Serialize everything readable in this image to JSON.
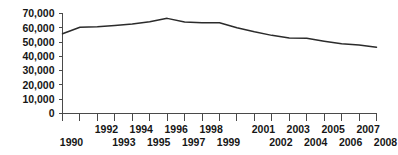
{
  "chart_data": {
    "type": "line",
    "title": "",
    "subtitle": "",
    "xlabel": "",
    "ylabel": "",
    "grid": false,
    "legend": false,
    "legend_position": "none",
    "x": [
      1990,
      1991,
      1992,
      1993,
      1994,
      1995,
      1996,
      1997,
      1998,
      1999,
      2000,
      2001,
      2002,
      2003,
      2004,
      2005,
      2006,
      2007,
      2008
    ],
    "categories": [
      "1990",
      "1991",
      "1992",
      "1993",
      "1994",
      "1995",
      "1996",
      "1997",
      "1998",
      "1999",
      "2000",
      "2001",
      "2002",
      "2003",
      "2004",
      "2005",
      "2006",
      "2007",
      "2008"
    ],
    "values": [
      55800,
      60400,
      60800,
      61600,
      62600,
      64200,
      66600,
      64100,
      63600,
      63500,
      60000,
      57200,
      54700,
      52800,
      52600,
      50600,
      48800,
      48000,
      46400
    ],
    "series": [
      {
        "name": "",
        "color": "#2b2b2b",
        "values": [
          55800,
          60400,
          60800,
          61600,
          62600,
          64200,
          66600,
          64100,
          63600,
          63500,
          60000,
          57200,
          54700,
          52800,
          52600,
          50600,
          48800,
          48000,
          46400
        ]
      }
    ],
    "xlim": [
      1990,
      2008
    ],
    "ylim": [
      0,
      70000
    ],
    "yticks": [
      0,
      10000,
      20000,
      30000,
      40000,
      50000,
      60000,
      70000
    ],
    "ytick_labels": [
      "0",
      "10,000",
      "20,000",
      "30,000",
      "40,000",
      "50,000",
      "60,000",
      "70,000"
    ],
    "xticks": [
      1990,
      1991,
      1992,
      1993,
      1994,
      1995,
      1996,
      1997,
      1998,
      1999,
      2000,
      2001,
      2002,
      2003,
      2004,
      2005,
      2006,
      2007,
      2008
    ],
    "xtick_labels_upper": [
      "",
      "",
      "1992",
      "",
      "1994",
      "",
      "1996",
      "",
      "1998",
      "",
      "",
      "2001",
      "",
      "2003",
      "",
      "2005",
      "",
      "2007",
      ""
    ],
    "xtick_labels_lower": [
      "1990",
      "",
      "",
      "1993",
      "",
      "1995",
      "",
      "1997",
      "",
      "1999",
      "",
      "",
      "2002",
      "",
      "2004",
      "",
      "2006",
      "",
      "2008"
    ],
    "line_color": "#2b2b2b",
    "axis_color": "#4a4a4a",
    "background_color": "#ffffff"
  }
}
